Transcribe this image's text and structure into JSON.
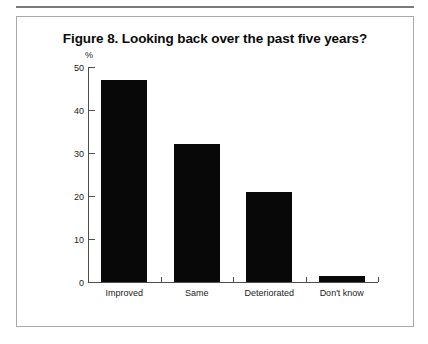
{
  "figure": {
    "title": "Figure 8. Looking back over the past five years?"
  },
  "chart_data": {
    "type": "bar",
    "title": "Figure 8. Looking back over the past five years?",
    "categories": [
      "Improved",
      "Same",
      "Deteriorated",
      "Don't know"
    ],
    "values": [
      47,
      32,
      21,
      1.5
    ],
    "xlabel": "",
    "ylabel": "%",
    "y_unit": "%",
    "ylim": [
      0,
      50
    ],
    "yticks": [
      0,
      10,
      20,
      30,
      40,
      50
    ],
    "ytick_labels": [
      "0",
      "10",
      "20",
      "30",
      "40",
      "50"
    ],
    "grid": false,
    "legend": false,
    "bar_color": "#080808",
    "axis_color": "#4d4d4d",
    "background": "#ffffff"
  }
}
